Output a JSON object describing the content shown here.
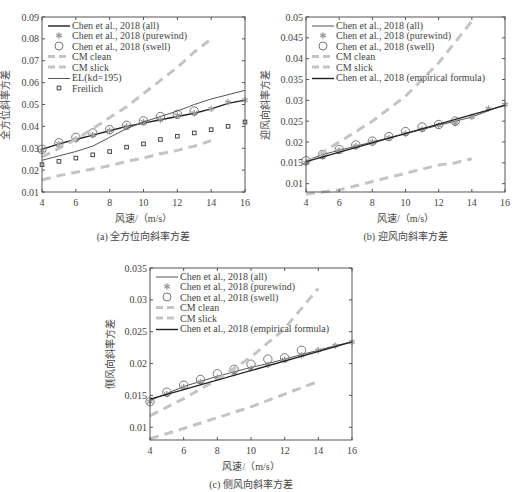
{
  "chart_data": [
    {
      "id": "a",
      "type": "line",
      "caption": "(a)  全方位向斜率方差",
      "xlabel": "风速/（m/s）",
      "ylabel": "全方位斜率方差",
      "xlim": [
        4,
        16
      ],
      "ylim": [
        0.01,
        0.09
      ],
      "xticks": [
        4,
        6,
        8,
        10,
        12,
        14,
        16
      ],
      "yticks": [
        0.01,
        0.02,
        0.03,
        0.04,
        0.05,
        0.06,
        0.07,
        0.08,
        0.09
      ],
      "ytick_labels": [
        "0.01",
        "0.02",
        "0.03",
        "0.04",
        "0.05",
        "0.06",
        "0.07",
        "0.08",
        "0.09"
      ],
      "box": [
        42,
        17,
        245,
        192
      ],
      "grid": false,
      "legend_position": "upper left",
      "series": [
        {
          "name": "Chen et al., 2018 (all)",
          "style": "line-dark",
          "x": [
            4,
            5,
            6,
            7,
            8,
            9,
            10,
            11,
            12,
            13,
            14,
            15,
            16
          ],
          "y": [
            0.0295,
            0.032,
            0.034,
            0.036,
            0.038,
            0.04,
            0.0415,
            0.043,
            0.0445,
            0.046,
            0.048,
            0.0505,
            0.052
          ]
        },
        {
          "name": "Chen et al., 2018 (purewind)",
          "style": "star",
          "x": [
            4,
            5,
            6,
            7,
            8,
            9,
            10,
            11,
            12,
            13,
            14,
            15,
            16
          ],
          "y": [
            0.029,
            0.032,
            0.034,
            0.036,
            0.038,
            0.04,
            0.042,
            0.043,
            0.045,
            0.046,
            0.048,
            0.051,
            0.052
          ]
        },
        {
          "name": "Chen et al., 2018 (swell)",
          "style": "circle",
          "x": [
            4,
            5,
            6,
            7,
            8,
            9,
            10,
            11,
            12,
            13
          ],
          "y": [
            0.0295,
            0.0325,
            0.035,
            0.037,
            0.0385,
            0.0405,
            0.0425,
            0.0445,
            0.0455,
            0.047
          ]
        },
        {
          "name": "CM clean",
          "style": "dash-light",
          "x": [
            4,
            5,
            6,
            7,
            8,
            9,
            10,
            11,
            12,
            13,
            14
          ],
          "y": [
            0.026,
            0.03,
            0.034,
            0.039,
            0.044,
            0.049,
            0.055,
            0.061,
            0.067,
            0.074,
            0.08
          ]
        },
        {
          "name": "CM slick",
          "style": "dash-light",
          "x": [
            4,
            5,
            6,
            7,
            8,
            9,
            10,
            11,
            12,
            13,
            14
          ],
          "y": [
            0.0155,
            0.0175,
            0.019,
            0.0205,
            0.022,
            0.024,
            0.0255,
            0.0275,
            0.029,
            0.031,
            0.0335
          ]
        },
        {
          "name": "EL(kd=195)",
          "style": "line-thin",
          "x": [
            4,
            5,
            6,
            7,
            8,
            9,
            10,
            11,
            12,
            13,
            14,
            15,
            16
          ],
          "y": [
            0.0245,
            0.0265,
            0.0285,
            0.031,
            0.035,
            0.039,
            0.042,
            0.0445,
            0.047,
            0.05,
            0.0525,
            0.0545,
            0.0565
          ]
        },
        {
          "name": "Freilich",
          "style": "square",
          "x": [
            4,
            5,
            6,
            7,
            8,
            9,
            10,
            11,
            12,
            13,
            14,
            15,
            16
          ],
          "y": [
            0.0225,
            0.024,
            0.0255,
            0.027,
            0.0285,
            0.0305,
            0.032,
            0.034,
            0.0355,
            0.037,
            0.0385,
            0.04,
            0.042
          ]
        }
      ]
    },
    {
      "id": "b",
      "type": "line",
      "caption": "(b)  迎风向斜率方差",
      "xlabel": "风速/（m/s）",
      "ylabel": "迎风向斜率方差",
      "xlim": [
        4,
        16
      ],
      "ylim": [
        0.008,
        0.05
      ],
      "xticks": [
        4,
        6,
        8,
        10,
        12,
        14,
        16
      ],
      "yticks": [
        0.01,
        0.015,
        0.02,
        0.025,
        0.03,
        0.035,
        0.04,
        0.045,
        0.05
      ],
      "ytick_labels": [
        "0.01",
        "0.015",
        "0.02",
        "0.025",
        "0.03",
        "0.035",
        "0.04",
        "0.045",
        "0.05"
      ],
      "box": [
        306,
        17,
        505,
        192
      ],
      "grid": false,
      "legend_position": "upper left",
      "series": [
        {
          "name": "Chen et al., 2018 (all)",
          "style": "line-thin",
          "x": [
            4,
            5,
            6,
            7,
            8,
            9,
            10,
            11,
            12,
            13,
            14,
            15,
            16
          ],
          "y": [
            0.0155,
            0.017,
            0.018,
            0.019,
            0.02,
            0.021,
            0.022,
            0.023,
            0.024,
            0.025,
            0.026,
            0.0275,
            0.029
          ]
        },
        {
          "name": "Chen et al., 2018 (purewind)",
          "style": "star",
          "x": [
            4,
            5,
            6,
            7,
            8,
            9,
            10,
            11,
            12,
            13,
            14,
            15,
            16
          ],
          "y": [
            0.015,
            0.0165,
            0.018,
            0.019,
            0.02,
            0.021,
            0.022,
            0.023,
            0.024,
            0.0245,
            0.026,
            0.028,
            0.029
          ]
        },
        {
          "name": "Chen et al., 2018 (swell)",
          "style": "circle",
          "x": [
            4,
            5,
            6,
            7,
            8,
            9,
            10,
            11,
            12,
            13
          ],
          "y": [
            0.0155,
            0.017,
            0.0182,
            0.0193,
            0.0202,
            0.0213,
            0.0225,
            0.0236,
            0.0242,
            0.025
          ]
        },
        {
          "name": "CM clean",
          "style": "dash-light",
          "x": [
            4,
            5,
            6,
            7,
            8,
            9,
            10,
            11,
            12,
            13,
            14
          ],
          "y": [
            0.015,
            0.0175,
            0.02,
            0.0225,
            0.025,
            0.028,
            0.031,
            0.035,
            0.039,
            0.044,
            0.049
          ]
        },
        {
          "name": "CM slick",
          "style": "dash-light",
          "x": [
            4,
            5,
            6,
            7,
            8,
            9,
            10,
            11,
            12,
            13,
            14
          ],
          "y": [
            0.0075,
            0.008,
            0.0085,
            0.0095,
            0.0105,
            0.0115,
            0.0125,
            0.0135,
            0.0145,
            0.015,
            0.016
          ]
        },
        {
          "name": "Chen et al., 2018 (empirical formula)",
          "style": "line-dark",
          "x": [
            4,
            16
          ],
          "y": [
            0.0153,
            0.0288
          ]
        }
      ]
    },
    {
      "id": "c",
      "type": "line",
      "caption": "(c)  侧风向斜率方差",
      "xlabel": "风速/（m/s）",
      "ylabel": "侧风向斜率方差",
      "xlim": [
        4,
        16
      ],
      "ylim": [
        0.008,
        0.035
      ],
      "xticks": [
        4,
        6,
        8,
        10,
        12,
        14,
        16
      ],
      "yticks": [
        0.01,
        0.015,
        0.02,
        0.025,
        0.03,
        0.035
      ],
      "ytick_labels": [
        "0.01",
        "0.015",
        "0.02",
        "0.025",
        "0.03",
        "0.035"
      ],
      "box": [
        150,
        268,
        352,
        440
      ],
      "grid": false,
      "legend_position": "upper left",
      "series": [
        {
          "name": "Chen et al., 2018 (all)",
          "style": "line-thin",
          "x": [
            4,
            5,
            6,
            7,
            8,
            9,
            10,
            11,
            12,
            13,
            14,
            15,
            16
          ],
          "y": [
            0.0142,
            0.0153,
            0.0164,
            0.0172,
            0.018,
            0.0187,
            0.0194,
            0.02,
            0.0207,
            0.0214,
            0.0221,
            0.0228,
            0.0234
          ]
        },
        {
          "name": "Chen et al., 2018 (purewind)",
          "style": "star",
          "x": [
            4,
            5,
            6,
            7,
            8,
            9,
            10,
            11,
            12,
            13,
            14,
            15,
            16
          ],
          "y": [
            0.014,
            0.0152,
            0.0163,
            0.0171,
            0.0178,
            0.0185,
            0.0192,
            0.0198,
            0.0206,
            0.0213,
            0.0221,
            0.0228,
            0.0234
          ]
        },
        {
          "name": "Chen et al., 2018 (swell)",
          "style": "circle",
          "x": [
            4,
            5,
            6,
            7,
            8,
            9,
            10,
            11,
            12,
            13
          ],
          "y": [
            0.014,
            0.0155,
            0.0166,
            0.0175,
            0.0184,
            0.0191,
            0.0199,
            0.0207,
            0.0209,
            0.0221
          ]
        },
        {
          "name": "CM clean",
          "style": "dash-light",
          "x": [
            4,
            6,
            8,
            10,
            12,
            14
          ],
          "y": [
            0.0118,
            0.0145,
            0.0175,
            0.021,
            0.0255,
            0.0318
          ]
        },
        {
          "name": "CM slick",
          "style": "dash-light",
          "x": [
            4,
            6,
            8,
            10,
            12,
            14
          ],
          "y": [
            0.0082,
            0.0098,
            0.0115,
            0.0132,
            0.0152,
            0.0172
          ]
        },
        {
          "name": "Chen et al., 2018 (empirical formula)",
          "style": "line-dark",
          "x": [
            4,
            16
          ],
          "y": [
            0.0144,
            0.0234
          ]
        }
      ]
    }
  ],
  "colors": {
    "axis": "#555555",
    "dark_line": "#222222",
    "thin_line": "#555555",
    "light_dash": "#c4c4c4",
    "marker": "#9a9a9a",
    "square": "#444444"
  }
}
